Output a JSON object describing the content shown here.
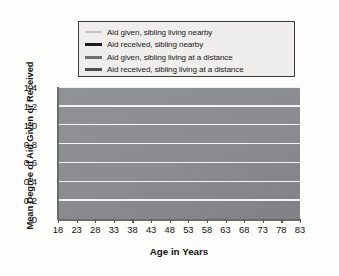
{
  "chart_data": {
    "type": "line",
    "title": "",
    "xlabel": "Age in Years",
    "ylabel": "Mean Degree of Aid Given or Received",
    "xlim": [
      18,
      83
    ],
    "ylim": [
      0,
      1.4
    ],
    "grid": true,
    "legend_position": "above-plot",
    "xticks": [
      "18",
      "23",
      "28",
      "33",
      "38",
      "43",
      "48",
      "53",
      "58",
      "63",
      "68",
      "73",
      "78",
      "83"
    ],
    "yticks": [
      "0",
      "0.2",
      "0.4",
      "0.6",
      "0.8",
      "1.0",
      "1.2",
      "1.4"
    ],
    "x": [
      18,
      23,
      28,
      33,
      38,
      43,
      48,
      53,
      58,
      63,
      68,
      73,
      78,
      83
    ],
    "series": [
      {
        "name": "Aid given, sibling living nearby",
        "color": "#c9c9c7",
        "width": 1.7,
        "values": [
          1.1,
          1.14,
          1.09,
          0.99,
          0.86,
          0.73,
          0.6,
          0.47,
          0.36,
          0.27,
          0.22,
          0.19,
          0.18,
          0.18
        ]
      },
      {
        "name": "Aid received, sibling nearby",
        "color": "#171715",
        "width": 3.1,
        "values": [
          0.75,
          0.78,
          0.77,
          0.74,
          0.69,
          0.62,
          0.54,
          0.45,
          0.36,
          0.27,
          0.2,
          0.19,
          0.26,
          0.4
        ]
      },
      {
        "name": "Aid given, sibling living at a distance",
        "color": "#6e6f70",
        "width": 2.5,
        "values": [
          0.71,
          0.71,
          0.68,
          0.63,
          0.57,
          0.49,
          0.41,
          0.33,
          0.26,
          0.2,
          0.15,
          0.12,
          0.1,
          0.1
        ]
      },
      {
        "name": "Aid received, sibling living at a distance",
        "color": "#4d4e4d",
        "width": 2.6,
        "values": [
          0.44,
          0.43,
          0.41,
          0.38,
          0.35,
          0.31,
          0.27,
          0.23,
          0.19,
          0.16,
          0.13,
          0.11,
          0.1,
          0.1
        ]
      }
    ]
  },
  "legend": {
    "items": [
      {
        "label": "Aid given, sibling living nearby"
      },
      {
        "label": "Aid received, sibling nearby"
      },
      {
        "label": "Aid given, sibling living at a distance"
      },
      {
        "label": "Aid received, sibling living at a distance"
      }
    ]
  },
  "axes": {
    "x_title": "Age in Years",
    "y_title": "Mean Degree of Aid Given or Received"
  }
}
